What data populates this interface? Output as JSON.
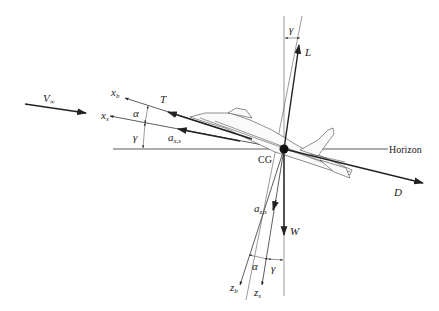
{
  "figure": {
    "type": "free-body diagram of aircraft in climb",
    "labels": {
      "freestream": {
        "main": "V",
        "sub": "∞"
      },
      "body_x_axis": {
        "main": "x",
        "sub": "b"
      },
      "stability_x_axis": {
        "main": "x",
        "sub": "s"
      },
      "thrust": "T",
      "alpha_upper": "α",
      "gamma_upper": "γ",
      "accel_x": {
        "main": "a",
        "sub": "x,s"
      },
      "lift": "L",
      "gamma_top": "γ",
      "center_of_gravity": "CG",
      "horizon": "Horizon",
      "drag": "D",
      "accel_z": {
        "main": "a",
        "sub": "z,s"
      },
      "weight": "W",
      "alpha_lower": "α",
      "gamma_lower": "γ",
      "body_z_axis": {
        "main": "z",
        "sub": "b"
      },
      "stability_z_axis": {
        "main": "z",
        "sub": "s"
      }
    }
  }
}
